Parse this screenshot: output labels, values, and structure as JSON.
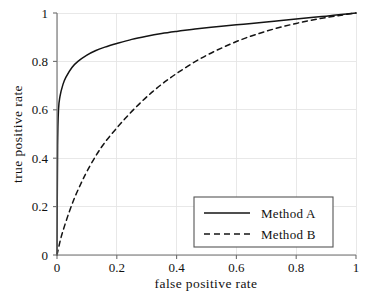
{
  "chart_data": {
    "type": "line",
    "title": "",
    "xlabel": "false positive rate",
    "ylabel": "true positive rate",
    "xlim": [
      0,
      1
    ],
    "ylim": [
      0,
      1
    ],
    "xticks": [
      "0",
      "0.2",
      "0.4",
      "0.6",
      "0.8",
      "1"
    ],
    "xtick_values": [
      0,
      0.2,
      0.4,
      0.6,
      0.8,
      1
    ],
    "yticks": [
      "0",
      "0.2",
      "0.4",
      "0.6",
      "0.8",
      "1"
    ],
    "ytick_values": [
      0,
      0.2,
      0.4,
      0.6,
      0.8,
      1
    ],
    "grid": true,
    "legend_position": "lower right",
    "series": [
      {
        "name": "Method A",
        "style": "solid",
        "color": "#141414",
        "x": [
          0,
          0.002,
          0.005,
          0.01,
          0.02,
          0.03,
          0.05,
          0.07,
          0.1,
          0.13,
          0.16,
          0.2,
          0.25,
          0.3,
          0.35,
          0.4,
          0.45,
          0.5,
          0.55,
          0.6,
          0.65,
          0.7,
          0.75,
          0.8,
          0.85,
          0.9,
          0.95,
          1
        ],
        "y": [
          0,
          0.45,
          0.6,
          0.655,
          0.705,
          0.735,
          0.775,
          0.8,
          0.826,
          0.845,
          0.859,
          0.874,
          0.891,
          0.904,
          0.915,
          0.924,
          0.932,
          0.939,
          0.945,
          0.951,
          0.957,
          0.963,
          0.969,
          0.975,
          0.981,
          0.987,
          0.994,
          1
        ]
      },
      {
        "name": "Method B",
        "style": "dashed",
        "color": "#141414",
        "x": [
          0,
          0.01,
          0.02,
          0.04,
          0.06,
          0.08,
          0.1,
          0.13,
          0.16,
          0.2,
          0.24,
          0.28,
          0.32,
          0.36,
          0.4,
          0.45,
          0.5,
          0.55,
          0.6,
          0.65,
          0.7,
          0.75,
          0.8,
          0.85,
          0.9,
          0.95,
          1
        ],
        "y": [
          0,
          0.055,
          0.1,
          0.175,
          0.24,
          0.295,
          0.345,
          0.41,
          0.465,
          0.525,
          0.58,
          0.63,
          0.675,
          0.715,
          0.75,
          0.79,
          0.825,
          0.855,
          0.882,
          0.905,
          0.925,
          0.942,
          0.957,
          0.97,
          0.981,
          0.991,
          1
        ]
      }
    ]
  },
  "legend": {
    "entries": [
      {
        "label": "Method A",
        "style": "solid"
      },
      {
        "label": "Method B",
        "style": "dashed"
      }
    ]
  }
}
